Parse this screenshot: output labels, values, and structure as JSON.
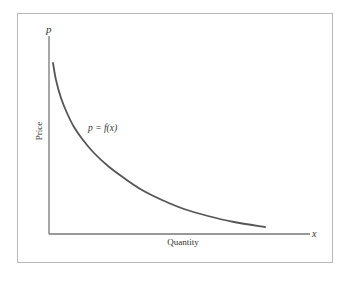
{
  "chart_data": {
    "type": "line",
    "title": "",
    "xlabel": "Quantity",
    "ylabel": "Price",
    "x_axis_symbol": "x",
    "y_axis_symbol": "p",
    "series": [
      {
        "name": "p = f(x)",
        "description": "decreasing convex demand curve",
        "points_px": [
          [
            53,
            63
          ],
          [
            56,
            80
          ],
          [
            61,
            98
          ],
          [
            67,
            113
          ],
          [
            74,
            127
          ],
          [
            83,
            140
          ],
          [
            94,
            153
          ],
          [
            108,
            166
          ],
          [
            124,
            178
          ],
          [
            142,
            190
          ],
          [
            162,
            200
          ],
          [
            184,
            209
          ],
          [
            208,
            216
          ],
          [
            234,
            222
          ],
          [
            265,
            227
          ]
        ]
      }
    ],
    "annotations": [
      {
        "text": "p = f(x)",
        "near": "upper-middle of curve"
      }
    ],
    "grid": false,
    "ticks": false
  },
  "labels": {
    "curve": "p = f(x)",
    "x_axis": "Quantity",
    "y_axis": "Price",
    "x_symbol": "x",
    "y_symbol": "p"
  },
  "colors": {
    "curve": "#555555",
    "axis": "#777777",
    "frame": "#b8b8b8"
  }
}
